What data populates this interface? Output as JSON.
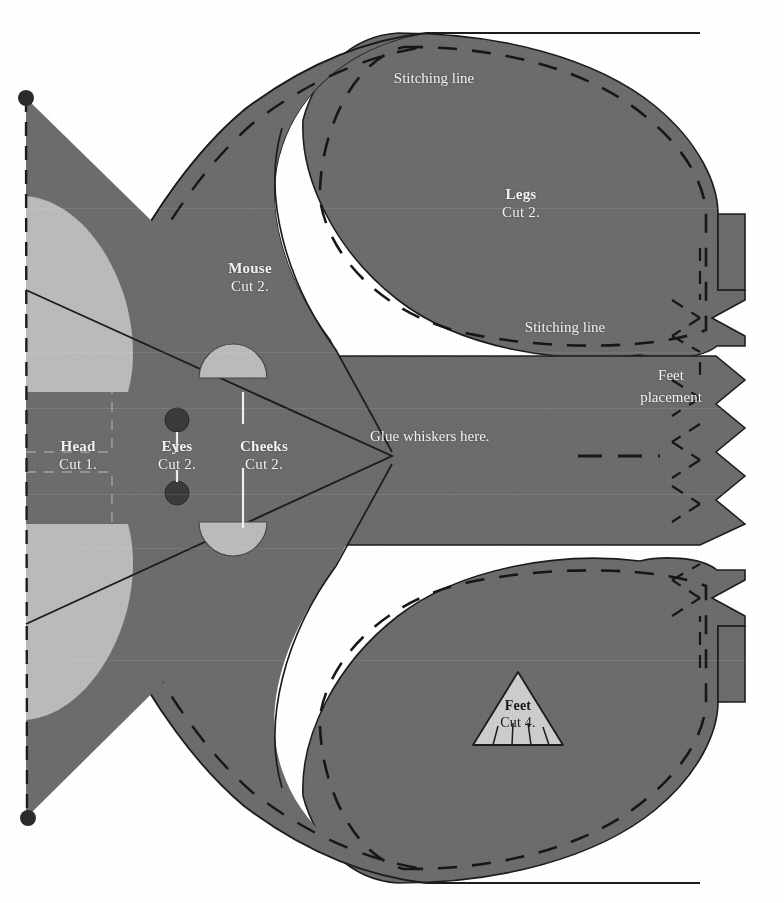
{
  "document": {
    "kind": "sewing-pattern-sheet",
    "title": "Mouse toy pattern pieces",
    "background_color": "#ffffff"
  },
  "palette": {
    "fabric_gray": "#6d6d6f",
    "fabric_gray_dark_edge": "#1d1d1f",
    "cheek_light": "#bcbcbc",
    "eye_dark": "#3b3b3d",
    "foot_light": "#cfcfcf",
    "label_light": "#f2f2f0",
    "label_dark": "#18181a",
    "paper_white": "#ffffff"
  },
  "pieces": [
    {
      "id": "head",
      "name": "Head",
      "cut": "Cut 1.",
      "label_color": "#f2f2f0",
      "x": 78,
      "y": 438
    },
    {
      "id": "eyes",
      "name": "Eyes",
      "cut": "Cut 2.",
      "label_color": "#f2f2f0",
      "x": 177,
      "y": 438
    },
    {
      "id": "cheeks",
      "name": "Cheeks",
      "cut": "Cut 2.",
      "label_color": "#f2f2f0",
      "x": 264,
      "y": 438
    },
    {
      "id": "mouse",
      "name": "Mouse",
      "cut": "Cut 2.",
      "label_color": "#f2f2f0",
      "x": 250,
      "y": 260
    },
    {
      "id": "legs",
      "name": "Legs",
      "cut": "Cut 2.",
      "label_color": "#f2f2f0",
      "x": 521,
      "y": 186
    },
    {
      "id": "feet",
      "name": "Feet",
      "cut": "Cut 4.",
      "label_color": "#18181a",
      "x": 518,
      "y": 704
    }
  ],
  "annotations": [
    {
      "id": "stitching-line-top",
      "text": "Stitching line",
      "x": 434,
      "y": 77,
      "color": "#f2f2f0",
      "align": "center"
    },
    {
      "id": "stitching-line-middle",
      "text": "Stitching line",
      "x": 565,
      "y": 326,
      "color": "#f2f2f0",
      "align": "center"
    },
    {
      "id": "feet-placement-1",
      "text": "Feet",
      "x": 671,
      "y": 374,
      "color": "#f2f2f0",
      "align": "center"
    },
    {
      "id": "feet-placement-2",
      "text": "placement",
      "x": 671,
      "y": 396,
      "color": "#f2f2f0",
      "align": "center"
    },
    {
      "id": "glue-whiskers",
      "text": "Glue whiskers here.",
      "x": 449,
      "y": 434,
      "color": "#f2f2f0",
      "align": "left"
    }
  ],
  "markers": {
    "registration_dots": [
      {
        "id": "top-fold-dot",
        "x": 26,
        "y": 98,
        "r": 8
      },
      {
        "id": "bottom-fold-dot",
        "x": 28,
        "y": 818,
        "r": 8
      }
    ],
    "eye_circles": [
      {
        "id": "eye-upper",
        "x": 177,
        "y": 420,
        "r": 12
      },
      {
        "id": "eye-lower",
        "x": 177,
        "y": 493,
        "r": 12
      }
    ],
    "fold_line": {
      "id": "left-fold-line",
      "x": 26,
      "y1": 98,
      "y2": 818,
      "style": "dashed"
    }
  },
  "legend": {
    "solid_line_meaning": "cutting line",
    "dashed_line_meaning": "stitching line"
  }
}
